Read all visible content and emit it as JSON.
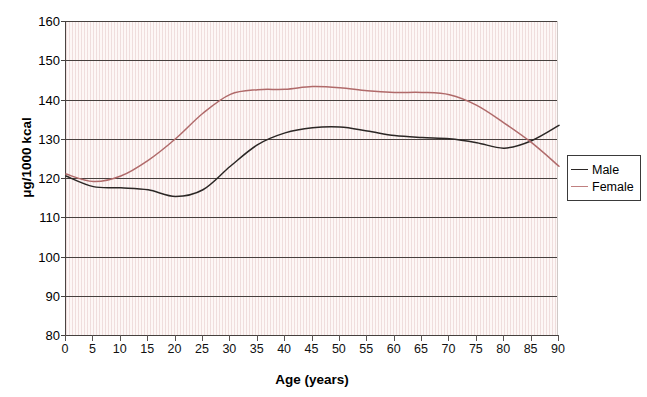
{
  "chart_data": {
    "type": "line",
    "title": "",
    "xlabel": "Age (years)",
    "ylabel": "μg/1000 kcal",
    "xlim": [
      0,
      90
    ],
    "ylim": [
      80,
      160
    ],
    "xticks": [
      0,
      5,
      10,
      15,
      20,
      25,
      30,
      35,
      40,
      45,
      50,
      55,
      60,
      65,
      70,
      75,
      80,
      85,
      90
    ],
    "yticks": [
      80,
      90,
      100,
      110,
      120,
      130,
      140,
      150,
      160
    ],
    "grid": "horizontal",
    "legend_position": "right",
    "x": [
      0,
      5,
      10,
      15,
      20,
      25,
      30,
      35,
      40,
      45,
      50,
      55,
      60,
      65,
      70,
      75,
      80,
      85,
      90
    ],
    "series": [
      {
        "name": "Male",
        "color": "#2b2725",
        "values": [
          120.5,
          117.8,
          117.5,
          117.0,
          115.3,
          117.0,
          123.0,
          128.5,
          131.5,
          132.8,
          133.0,
          132.0,
          130.8,
          130.3,
          130.0,
          129.0,
          127.6,
          129.5,
          133.4
        ]
      },
      {
        "name": "Female",
        "color": "#b06a6a",
        "values": [
          121.0,
          119.1,
          120.5,
          124.5,
          130.0,
          136.5,
          141.3,
          142.5,
          142.6,
          143.3,
          143.0,
          142.2,
          141.8,
          141.8,
          141.2,
          138.5,
          134.0,
          129.0,
          123.0
        ]
      }
    ]
  },
  "legend": {
    "entries": [
      {
        "label": "Male",
        "color": "#2b2725"
      },
      {
        "label": "Female",
        "color": "#c08080"
      }
    ]
  },
  "axes": {
    "y_title": "μg/1000 kcal",
    "x_title": "Age (years)"
  },
  "colors": {
    "male_line": "#2b2725",
    "female_line": "#b06a6a",
    "gridline": "#46403e",
    "plot_background": "#fdf7f6",
    "axis": "#46403e"
  }
}
